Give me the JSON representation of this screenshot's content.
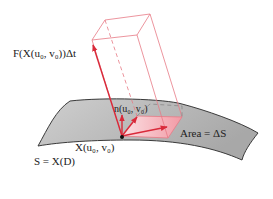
{
  "figure": {
    "labels": {
      "flux_vector": "F(X(u₀, v₀))Δt",
      "normal": "n(u₀, v₀)",
      "base_point": "X(u₀, v₀)",
      "area": "Area = ΔS",
      "surface": "S = X(D)"
    },
    "colors": {
      "accent_red": "#d92a3a",
      "box_edge": "#e77a85",
      "patch_fill": "#f4a3ac",
      "surface_fill": "#bdbdbd",
      "surface_edge": "#444444",
      "text": "#222222"
    }
  }
}
